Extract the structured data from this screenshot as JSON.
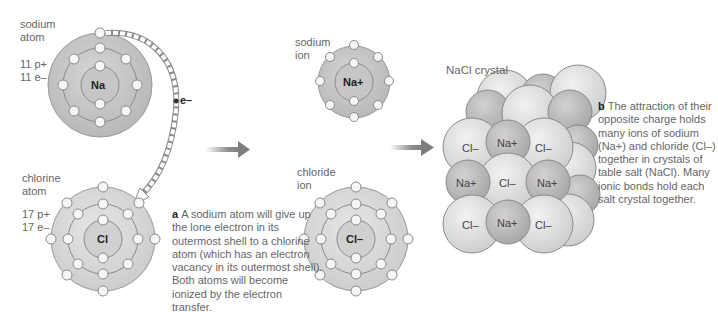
{
  "sodium_atom": {
    "label_line1": "sodium",
    "label_line2": "atom",
    "protons": "11 p+",
    "electrons": "11 e–",
    "symbol": "Na"
  },
  "chlorine_atom": {
    "label_line1": "chlorine",
    "label_line2": "atom",
    "protons": "17 p+",
    "electrons": "17 e–",
    "symbol": "Cl"
  },
  "electron_transfer": {
    "label": "e–"
  },
  "caption_a": {
    "letter": "a",
    "text": "A sodium atom will give up the lone electron in its outermost shell to a chlorine atom (which has an electron vacancy in its outermost shell). Both atoms will become ionized by the electron transfer."
  },
  "sodium_ion": {
    "label_line1": "sodium",
    "label_line2": "ion",
    "symbol": "Na+"
  },
  "chloride_ion": {
    "label_line1": "chloride",
    "label_line2": "ion",
    "symbol": "Cl–"
  },
  "crystal": {
    "title": "NaCl crystal",
    "front_grid": [
      [
        "Cl–",
        "Na+",
        "Cl–"
      ],
      [
        "Na+",
        "Cl–",
        "Na+"
      ],
      [
        "Cl–",
        "Na+",
        "Cl–"
      ]
    ]
  },
  "caption_b": {
    "letter": "b",
    "text": "The attraction of their opposite charge holds many ions of sodium (Na+) and chloride (Cl–) together in crystals of table salt (NaCl). Many ionic bonds hold each salt crystal together."
  },
  "colors": {
    "outer_shell": "#c8c8c8",
    "inner_shell": "#d4d4d4",
    "nucleus": "#c4c4c4",
    "electron": "#f4f4f4",
    "arrow": "#8a8a8a",
    "cl_ion": "#dedede",
    "na_ion": "#bdbdbd"
  }
}
